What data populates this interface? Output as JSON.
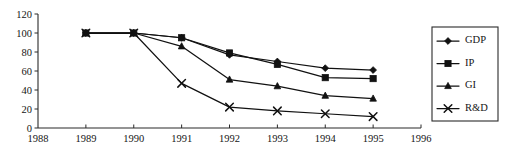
{
  "chart_data": {
    "type": "line",
    "title": "",
    "subtitle": "",
    "xlabel": "",
    "ylabel": "",
    "x": [
      1989,
      1990,
      1991,
      1992,
      1993,
      1994,
      1995
    ],
    "xlim": [
      1988,
      1996
    ],
    "ylim": [
      0,
      120
    ],
    "xticks": [
      1988,
      1989,
      1990,
      1991,
      1992,
      1993,
      1994,
      1995,
      1996
    ],
    "yticks": [
      0,
      20,
      40,
      60,
      80,
      100,
      120
    ],
    "xtick_labels": [
      "1988",
      "1989",
      "1990",
      "1991",
      "1992",
      "1993",
      "1994",
      "1995",
      "1996"
    ],
    "ytick_labels": [
      "0",
      "20",
      "40",
      "60",
      "80",
      "100",
      "120"
    ],
    "grid": false,
    "legend_position": "right",
    "series": [
      {
        "name": "GDP",
        "marker": "diamond",
        "color": "#111111",
        "values": [
          100,
          100,
          95,
          77,
          70,
          63,
          61
        ]
      },
      {
        "name": "IP",
        "marker": "square",
        "color": "#111111",
        "values": [
          100,
          100,
          95,
          79,
          67,
          53,
          52
        ]
      },
      {
        "name": "GI",
        "marker": "triangle",
        "color": "#111111",
        "values": [
          100,
          100,
          86,
          51,
          44,
          34,
          31
        ]
      },
      {
        "name": "R&D",
        "marker": "cross",
        "color": "#111111",
        "values": [
          100,
          100,
          47,
          22,
          18,
          15,
          12
        ]
      }
    ]
  },
  "legend": {
    "entries": [
      {
        "label": "GDP",
        "marker": "diamond"
      },
      {
        "label": "IP",
        "marker": "square"
      },
      {
        "label": "GI",
        "marker": "triangle"
      },
      {
        "label": "R&D",
        "marker": "cross"
      }
    ]
  }
}
